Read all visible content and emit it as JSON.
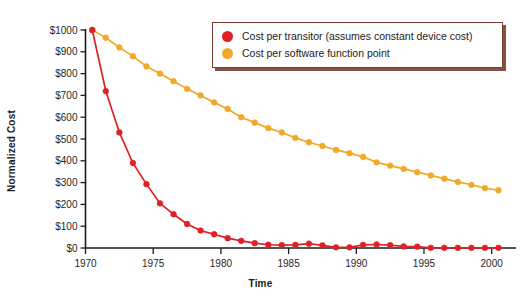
{
  "chart_data": {
    "type": "line",
    "title": "",
    "xlabel": "Time",
    "ylabel": "Normalized Cost",
    "xlim": [
      1970,
      2001.5
    ],
    "ylim": [
      0,
      1000
    ],
    "grid": false,
    "legend_position": "top-right",
    "xticks": [
      1970,
      1975,
      1980,
      1985,
      1990,
      1995,
      2000
    ],
    "xticklabels": [
      "1970",
      "1975",
      "1980",
      "1985",
      "1990",
      "1995",
      "2000"
    ],
    "yticks": [
      0,
      100,
      200,
      300,
      400,
      500,
      600,
      700,
      800,
      900,
      1000
    ],
    "yticklabels": [
      "$0",
      "$100",
      "$200",
      "$300",
      "$400",
      "$500",
      "$600",
      "$700",
      "$800",
      "$900",
      "$1000"
    ],
    "x": [
      1970.5,
      1971.5,
      1972.5,
      1973.5,
      1974.5,
      1975.5,
      1976.5,
      1977.5,
      1978.5,
      1979.5,
      1980.5,
      1981.5,
      1982.5,
      1983.5,
      1984.5,
      1985.5,
      1986.5,
      1987.5,
      1988.5,
      1989.5,
      1990.5,
      1991.5,
      1992.5,
      1993.5,
      1994.5,
      1995.5,
      1996.5,
      1997.5,
      1998.5,
      1999.5,
      2000.5
    ],
    "series": [
      {
        "name": "Cost per transitor (assumes constant device cost)",
        "color": "#E02027",
        "marker": "circle",
        "values": [
          1000,
          720,
          530,
          390,
          293,
          205,
          155,
          110,
          80,
          63,
          45,
          33,
          22,
          15,
          13,
          14,
          20,
          12,
          3,
          3,
          14,
          16,
          13,
          7,
          6,
          1,
          1,
          1,
          1,
          1,
          1
        ]
      },
      {
        "name": "Cost per software function point",
        "color": "#F0A92B",
        "marker": "circle",
        "values": [
          1000,
          965,
          920,
          880,
          833,
          800,
          765,
          730,
          700,
          668,
          638,
          600,
          575,
          550,
          530,
          505,
          485,
          468,
          450,
          435,
          418,
          393,
          378,
          363,
          348,
          333,
          318,
          303,
          290,
          275,
          265
        ]
      }
    ]
  },
  "axes": {
    "ylabel": "Normalized Cost",
    "xlabel": "Time"
  },
  "legend": {
    "items": [
      {
        "label": "Cost per transitor (assumes constant device cost)",
        "color": "#E02027"
      },
      {
        "label": "Cost per software function point",
        "color": "#F0A92B"
      }
    ]
  },
  "colors": {
    "series_red": "#E02027",
    "series_orange": "#F0A92B",
    "axis": "#1b1b1b",
    "legend_border": "#7d3b2e",
    "background": "#ffffff"
  }
}
